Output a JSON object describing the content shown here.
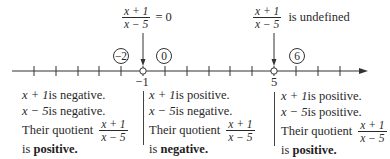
{
  "diagram": {
    "type": "sign-chart-number-line",
    "expression": {
      "numerator": "x + 1",
      "denominator": "x − 5"
    },
    "top_annotations": [
      {
        "id": "zero",
        "suffix": "= 0",
        "at_value": -1
      },
      {
        "id": "undefined",
        "suffix": "is undefined",
        "at_value": 5
      }
    ],
    "critical_points": [
      {
        "value": -1,
        "label": "−1",
        "marker": "open-circle"
      },
      {
        "value": 5,
        "label": "5",
        "marker": "open-circle"
      }
    ],
    "test_values": [
      {
        "label": "−2",
        "value": -2
      },
      {
        "label": "0",
        "value": 0
      },
      {
        "label": "6",
        "value": 6
      }
    ],
    "axis": {
      "min_tick": -6,
      "max_tick": 8,
      "arrow": "right"
    },
    "regions": [
      {
        "line1_expr": "x + 1",
        "line1_text": " is negative.",
        "line2_expr": "x − 5",
        "line2_text": " is negative.",
        "line3_text": "Their quotient",
        "line4_prefix": "is ",
        "line4_bold": "positive."
      },
      {
        "line1_expr": "x + 1",
        "line1_text": " is positive.",
        "line2_expr": "x − 5",
        "line2_text": " is negative.",
        "line3_text": "Their quotient",
        "line4_prefix": "is ",
        "line4_bold": "negative."
      },
      {
        "line1_expr": "x + 1",
        "line1_text": " is positive.",
        "line2_expr": "x − 5",
        "line2_text": " is positive.",
        "line3_text": "Their quotient",
        "line4_prefix": "is ",
        "line4_bold": "positive."
      }
    ]
  }
}
